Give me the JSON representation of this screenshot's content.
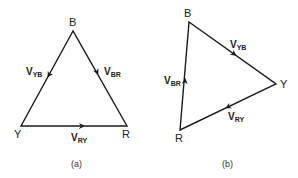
{
  "diagrams": [
    {
      "caption": "(a)",
      "vertices": {
        "B": "B",
        "Y": "Y",
        "R": "R"
      },
      "vectors": {
        "yb": {
          "main": "V",
          "sub": "YB"
        },
        "br": {
          "main": "V",
          "sub": "BR"
        },
        "ry": {
          "main": "V",
          "sub": "RY"
        }
      }
    },
    {
      "caption": "(b)",
      "vertices": {
        "B": "B",
        "Y": "Y",
        "R": "R"
      },
      "vectors": {
        "yb": {
          "main": "V",
          "sub": "YB"
        },
        "br": {
          "main": "V",
          "sub": "BR"
        },
        "ry": {
          "main": "V",
          "sub": "RY"
        }
      }
    }
  ],
  "colors": {
    "line": "#1a1a1a",
    "background": "#ffffff"
  }
}
